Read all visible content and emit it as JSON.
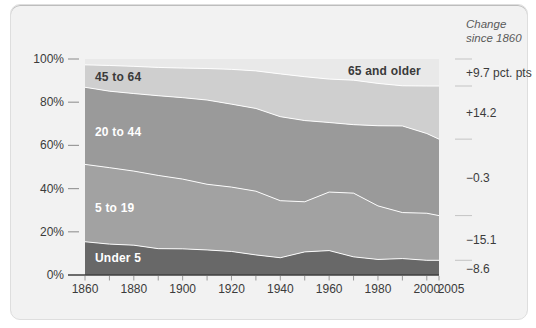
{
  "annotation": {
    "header_line1": "Change",
    "header_line2": "since 1860"
  },
  "colors": {
    "card_bg": "#f2f2f2",
    "axis": "#3f3f3f",
    "tick": "#9a9a9a",
    "right_tick": "#c4c4c4",
    "separator": "#ffffff",
    "text_dark": "#3b3b3b",
    "text_light": "#ffffff"
  },
  "chart_data": {
    "type": "area",
    "stacked": true,
    "title": "",
    "xlabel": "",
    "ylabel": "",
    "xlim": [
      1860,
      2005
    ],
    "ylim": [
      0,
      100
    ],
    "grid": false,
    "legend_position": "inside-bands",
    "x": [
      1860,
      1870,
      1880,
      1890,
      1900,
      1910,
      1920,
      1930,
      1940,
      1950,
      1960,
      1970,
      1980,
      1990,
      2000,
      2005
    ],
    "x_tick_labels": [
      "1860",
      "1880",
      "1900",
      "1920",
      "1940",
      "1960",
      "1980",
      "2000",
      "2005"
    ],
    "y_ticks": [
      0,
      20,
      40,
      60,
      80,
      100
    ],
    "y_tick_suffix": "%",
    "series": [
      {
        "name": "Under 5",
        "color": "#686868",
        "text_color": "#ffffff",
        "change": "−8.6",
        "values": [
          15.4,
          14.3,
          13.8,
          12.2,
          12.1,
          11.6,
          10.9,
          9.3,
          8.0,
          10.7,
          11.3,
          8.4,
          7.2,
          7.6,
          6.8,
          6.8
        ]
      },
      {
        "name": "5 to 19",
        "color": "#a2a2a2",
        "text_color": "#ffffff",
        "change": "−15.1",
        "values": [
          35.8,
          35.4,
          34.3,
          33.9,
          32.3,
          30.4,
          29.8,
          29.5,
          26.4,
          23.2,
          27.1,
          29.5,
          24.8,
          21.3,
          21.8,
          20.7
        ]
      },
      {
        "name": "20 to 44",
        "color": "#9a9a9a",
        "text_color": "#ffffff",
        "change": "−0.3",
        "values": [
          35.7,
          35.4,
          35.9,
          36.9,
          37.7,
          39.0,
          38.4,
          38.3,
          38.9,
          37.6,
          32.2,
          31.7,
          37.1,
          40.1,
          36.9,
          35.4
        ]
      },
      {
        "name": "45 to 64",
        "color": "#cfcfcf",
        "text_color": "#3a3a3a",
        "change": "+14.2",
        "values": [
          10.4,
          11.9,
          12.6,
          13.1,
          13.7,
          14.6,
          16.1,
          17.4,
          19.8,
          20.3,
          20.1,
          20.6,
          19.6,
          18.6,
          22.0,
          24.6
        ]
      },
      {
        "name": "65 and older",
        "color": "#e9e9e9",
        "text_color": "#3a3a3a",
        "change": "+9.7 pct. pts",
        "values": [
          2.7,
          3.0,
          3.4,
          3.9,
          4.1,
          4.3,
          4.7,
          5.4,
          6.8,
          8.1,
          9.2,
          9.8,
          11.3,
          12.5,
          12.4,
          12.4
        ]
      }
    ]
  }
}
